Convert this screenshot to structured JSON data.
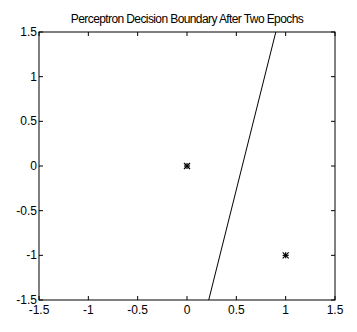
{
  "chart_data": {
    "type": "scatter",
    "title": "Perceptron Decision Boundary After Two Epochs",
    "xlabel": "",
    "ylabel": "",
    "xlim": [
      -1.5,
      1.5
    ],
    "ylim": [
      -1.5,
      1.5
    ],
    "xticks": [
      "-1.5",
      "-1",
      "-0.5",
      "0",
      "0.5",
      "1",
      "1.5"
    ],
    "yticks": [
      "1.5",
      "1",
      "0.5",
      "0",
      "-0.5",
      "-1",
      "-1.5"
    ],
    "grid": false,
    "points": [
      {
        "x": 0,
        "y": 0,
        "marker": "*"
      },
      {
        "x": 1,
        "y": -1,
        "marker": "*"
      }
    ],
    "decision_boundary": {
      "x1": 0.9,
      "y1": 1.5,
      "x2": 0.22,
      "y2": -1.5
    }
  }
}
